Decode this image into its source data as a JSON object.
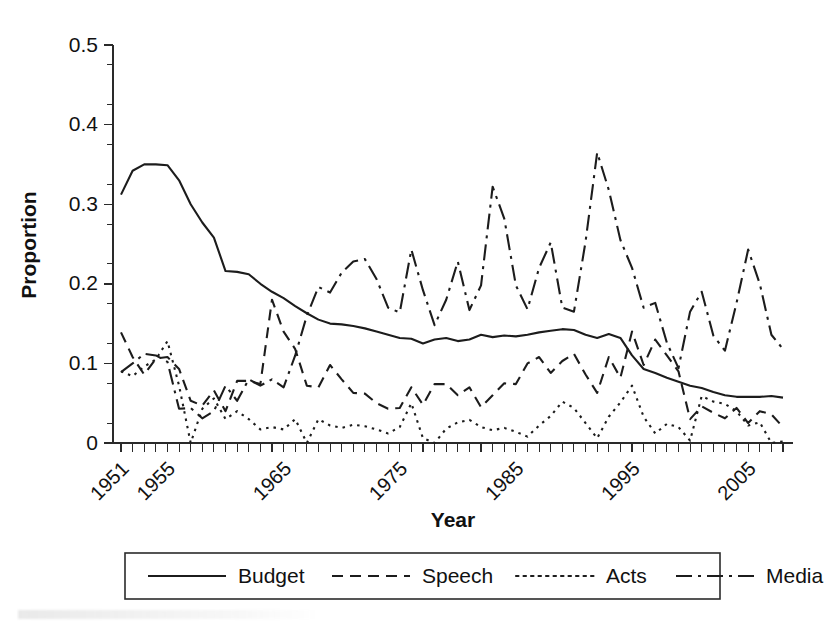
{
  "chart_data": {
    "type": "line",
    "title": "",
    "xlabel": "Year",
    "ylabel": "Proportion",
    "xlim": [
      1951,
      2008
    ],
    "ylim": [
      0,
      0.5
    ],
    "grid": false,
    "legend_position": "bottom",
    "ytick_labels": [
      "0",
      "0.1",
      "0.2",
      "0.3",
      "0.4",
      "0.5"
    ],
    "ytick_values": [
      0,
      0.1,
      0.2,
      0.3,
      0.4,
      0.5
    ],
    "yminor_step": 0.025,
    "xtick_labels": [
      "1951",
      "1955",
      "1965",
      "1975",
      "1985",
      "1995",
      "2005"
    ],
    "xtick_values": [
      1951,
      1955,
      1965,
      1975,
      1985,
      1995,
      2005
    ],
    "x": [
      1951,
      1952,
      1953,
      1954,
      1955,
      1956,
      1957,
      1958,
      1959,
      1960,
      1961,
      1962,
      1963,
      1964,
      1965,
      1966,
      1967,
      1968,
      1969,
      1970,
      1971,
      1972,
      1973,
      1974,
      1975,
      1976,
      1977,
      1978,
      1979,
      1980,
      1981,
      1982,
      1983,
      1984,
      1985,
      1986,
      1987,
      1988,
      1989,
      1990,
      1991,
      1992,
      1993,
      1994,
      1995,
      1996,
      1997,
      1998,
      1999,
      2000,
      2001,
      2002,
      2003,
      2004,
      2005,
      2006,
      2007,
      2008
    ],
    "series": [
      {
        "name": "Budget",
        "style": "solid",
        "dash": "none",
        "values": [
          0.312,
          0.342,
          0.35,
          0.35,
          0.349,
          0.33,
          0.3,
          0.277,
          0.258,
          0.216,
          0.215,
          0.212,
          0.2,
          0.19,
          0.182,
          0.172,
          0.163,
          0.155,
          0.15,
          0.149,
          0.147,
          0.144,
          0.14,
          0.136,
          0.132,
          0.131,
          0.125,
          0.13,
          0.132,
          0.128,
          0.13,
          0.136,
          0.133,
          0.135,
          0.134,
          0.136,
          0.139,
          0.141,
          0.143,
          0.142,
          0.136,
          0.132,
          0.137,
          0.132,
          0.11,
          0.093,
          0.088,
          0.082,
          0.077,
          0.072,
          0.069,
          0.064,
          0.06,
          0.058,
          0.058,
          0.058,
          0.059,
          0.057
        ]
      },
      {
        "name": "Speech",
        "style": "dashed",
        "dash": "11,7",
        "values": [
          0.139,
          0.108,
          0.086,
          0.106,
          0.108,
          0.093,
          0.053,
          0.047,
          0.066,
          0.04,
          0.078,
          0.078,
          0.074,
          0.18,
          0.14,
          0.118,
          0.072,
          0.07,
          0.098,
          0.08,
          0.063,
          0.062,
          0.05,
          0.043,
          0.044,
          0.07,
          0.048,
          0.074,
          0.074,
          0.06,
          0.07,
          0.045,
          0.06,
          0.075,
          0.074,
          0.1,
          0.108,
          0.088,
          0.103,
          0.112,
          0.086,
          0.063,
          0.108,
          0.082,
          0.14,
          0.098,
          0.13,
          0.11,
          0.09,
          0.03,
          0.046,
          0.038,
          0.031,
          0.044,
          0.025,
          0.04,
          0.036,
          0.02
        ]
      },
      {
        "name": "Acts",
        "style": "dotted",
        "dash": "2.5,5",
        "values": [
          0.09,
          0.084,
          0.096,
          0.105,
          0.128,
          0.072,
          0.0,
          0.043,
          0.056,
          0.03,
          0.04,
          0.03,
          0.017,
          0.02,
          0.017,
          0.03,
          0.0,
          0.03,
          0.022,
          0.019,
          0.023,
          0.021,
          0.017,
          0.012,
          0.02,
          0.05,
          0.006,
          0.0,
          0.018,
          0.026,
          0.029,
          0.02,
          0.016,
          0.019,
          0.014,
          0.008,
          0.022,
          0.034,
          0.052,
          0.044,
          0.025,
          0.006,
          0.033,
          0.051,
          0.072,
          0.033,
          0.012,
          0.024,
          0.02,
          0.003,
          0.059,
          0.052,
          0.049,
          0.04,
          0.022,
          0.026,
          0.0,
          0.002
        ]
      },
      {
        "name": "Media",
        "style": "dashdot",
        "dash": "16,6,3,6",
        "values": [
          0.089,
          0.1,
          0.112,
          0.11,
          0.102,
          0.043,
          0.044,
          0.031,
          0.04,
          0.072,
          0.053,
          0.08,
          0.072,
          0.08,
          0.07,
          0.11,
          0.16,
          0.196,
          0.189,
          0.214,
          0.228,
          0.231,
          0.206,
          0.17,
          0.164,
          0.243,
          0.192,
          0.148,
          0.18,
          0.228,
          0.167,
          0.198,
          0.322,
          0.282,
          0.198,
          0.168,
          0.22,
          0.252,
          0.17,
          0.165,
          0.253,
          0.365,
          0.318,
          0.255,
          0.22,
          0.17,
          0.176,
          0.126,
          0.094,
          0.165,
          0.19,
          0.135,
          0.116,
          0.176,
          0.243,
          0.2,
          0.136,
          0.118
        ]
      }
    ]
  },
  "legend": {
    "entries": [
      {
        "label": "Budget",
        "style": "solid"
      },
      {
        "label": "Speech",
        "style": "dashed"
      },
      {
        "label": "Acts",
        "style": "dotted"
      },
      {
        "label": "Media",
        "style": "dashdot"
      }
    ]
  },
  "colors": {
    "ink": "#1c1c1c",
    "axis": "#2a2a2a",
    "background": "#ffffff"
  }
}
